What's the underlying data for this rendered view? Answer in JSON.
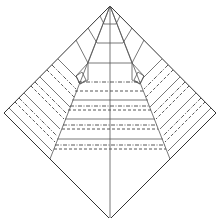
{
  "diagram": {
    "type": "origami-crease-pattern",
    "line_styles": {
      "edge": "solid",
      "crease": "solid",
      "valley_fold": "dashed",
      "mountain_fold": "dash-dot"
    },
    "colors": {
      "background": "#ffffff",
      "line": "#333333"
    },
    "vertices": {
      "top": [
        110,
        6
      ],
      "left": [
        4,
        113
      ],
      "right": [
        216,
        113
      ],
      "bottom": [
        110,
        219
      ]
    },
    "horizontal_bands_y": [
      {
        "y": 63,
        "style": "solid"
      },
      {
        "y": 82,
        "style": "mountain"
      },
      {
        "y": 91,
        "style": "valley"
      },
      {
        "y": 100,
        "style": "solid"
      },
      {
        "y": 106,
        "style": "mountain"
      },
      {
        "y": 110,
        "style": "valley"
      },
      {
        "y": 119,
        "style": "solid"
      },
      {
        "y": 125,
        "style": "mountain"
      },
      {
        "y": 129,
        "style": "valley"
      },
      {
        "y": 139,
        "style": "solid"
      },
      {
        "y": 145,
        "style": "mountain"
      },
      {
        "y": 149,
        "style": "valley"
      }
    ]
  }
}
